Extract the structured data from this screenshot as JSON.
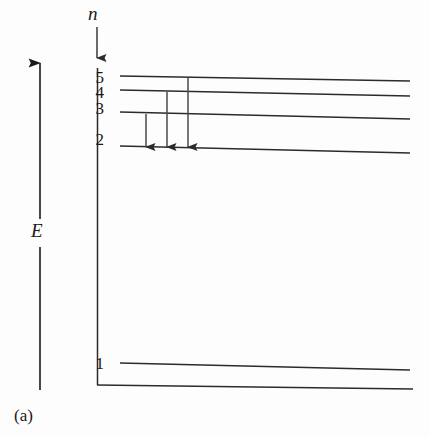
{
  "figure": {
    "caption": "(a)",
    "type": "energy-level-diagram",
    "axes": {
      "vertical_energy_axis": {
        "label": "E",
        "direction": "up",
        "x": 40,
        "y_top": 63,
        "y_bottom": 390,
        "gap_top": 219,
        "gap_bottom": 247
      },
      "quantum_number_axis": {
        "label": "n",
        "direction": "down",
        "x": 97,
        "y_top": 27,
        "y_bottom": 58
      },
      "frame": {
        "vertical_x": 97,
        "vertical_y_top": 68,
        "vertical_y_bottom": 385,
        "horizontal_y": 385,
        "horizontal_x_start": 97,
        "horizontal_x_end": 413
      }
    },
    "levels": [
      {
        "n": "5",
        "label_x": 88,
        "label_y": 69,
        "line_x_start": 120,
        "line_x_end": 410,
        "line_y_start": 76,
        "line_y_end": 81
      },
      {
        "n": "4",
        "label_x": 88,
        "label_y": 84,
        "line_x_start": 120,
        "line_x_end": 410,
        "line_y_start": 90,
        "line_y_end": 96
      },
      {
        "n": "3",
        "label_x": 88,
        "label_y": 100,
        "line_x_start": 120,
        "line_x_end": 410,
        "line_y_start": 112,
        "line_y_end": 119
      },
      {
        "n": "2",
        "label_x": 88,
        "label_y": 131,
        "line_x_start": 120,
        "line_x_end": 410,
        "line_y_start": 146,
        "line_y_end": 153
      },
      {
        "n": "1",
        "label_x": 88,
        "label_y": 355,
        "line_x_start": 120,
        "line_x_end": 410,
        "line_y_start": 363,
        "line_y_end": 370
      }
    ],
    "transitions": [
      {
        "name": "transition-3-to-2",
        "from_level": "3",
        "to_level": "2",
        "x": 146,
        "y_start": 114,
        "y_end": 147
      },
      {
        "name": "transition-4-to-2",
        "from_level": "4",
        "to_level": "2",
        "x": 167,
        "y_start": 92,
        "y_end": 147
      },
      {
        "name": "transition-5-to-2",
        "from_level": "5",
        "to_level": "2",
        "x": 188,
        "y_start": 78,
        "y_end": 147
      }
    ],
    "colors": {
      "ink": "#1a1a1a",
      "line": "#2b2b2b",
      "background": "#fdfdfd"
    }
  }
}
